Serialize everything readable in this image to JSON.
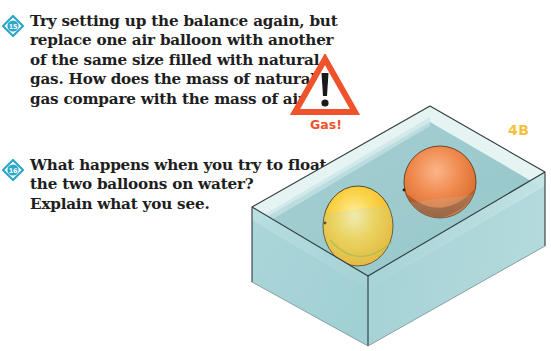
{
  "questions": [
    {
      "number": "15",
      "lines": [
        "Try setting up the balance again, but",
        "replace one air balloon with another",
        "of the same size filled with natural",
        "gas. How does the mass of natural",
        "gas compare with the mass of air?"
      ]
    },
    {
      "number": "16",
      "lines": [
        "What happens when you try to float",
        "the two balloons on water?",
        "Explain what you see."
      ]
    }
  ],
  "warning": {
    "icon": "warning-triangle-icon",
    "label": "Gas!",
    "color": "#f0532c"
  },
  "section": {
    "label": "4B",
    "color": "#f6c13a"
  },
  "illustration": {
    "description": "Glass tank of water with two floating balloons",
    "balloons": [
      {
        "name": "air-balloon",
        "color": "#f7c832"
      },
      {
        "name": "natural-gas-balloon",
        "color": "#ef8a48"
      }
    ],
    "water_color": "#a9d3d6"
  }
}
